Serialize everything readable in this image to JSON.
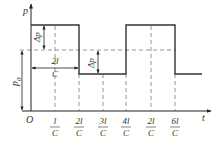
{
  "diagram": {
    "type": "pressure-time square wave (water hammer)",
    "axes": {
      "y_label": "p",
      "x_label": "t",
      "origin_label": "O"
    },
    "x_ticks": [
      {
        "num": "l",
        "den": "C"
      },
      {
        "num": "2l",
        "den": "C"
      },
      {
        "num": "3l",
        "den": "C"
      },
      {
        "num": "4l",
        "den": "C"
      },
      {
        "num": "2l",
        "den": "C"
      },
      {
        "num": "6l",
        "den": "C"
      }
    ],
    "annotations": {
      "delta_p_upper": "Δp",
      "delta_p_lower": "Δp",
      "period_num": "2l",
      "period_den": "C",
      "p0_label": "p",
      "p0_sub": "0"
    },
    "colors": {
      "line": "#333333",
      "dashed": "#888888",
      "background": "#ffffff"
    }
  }
}
